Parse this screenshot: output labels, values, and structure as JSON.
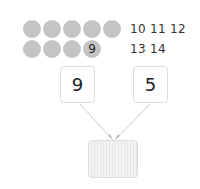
{
  "counting": {
    "row1_dots": 5,
    "row2_dots": 4,
    "marked_dot_label": "9",
    "row1_numbers": "10 11 12",
    "row2_numbers": "13 14",
    "dot_color": "#c4c4c4"
  },
  "addends": {
    "left": "9",
    "right": "5"
  },
  "answer": {
    "value": ""
  }
}
